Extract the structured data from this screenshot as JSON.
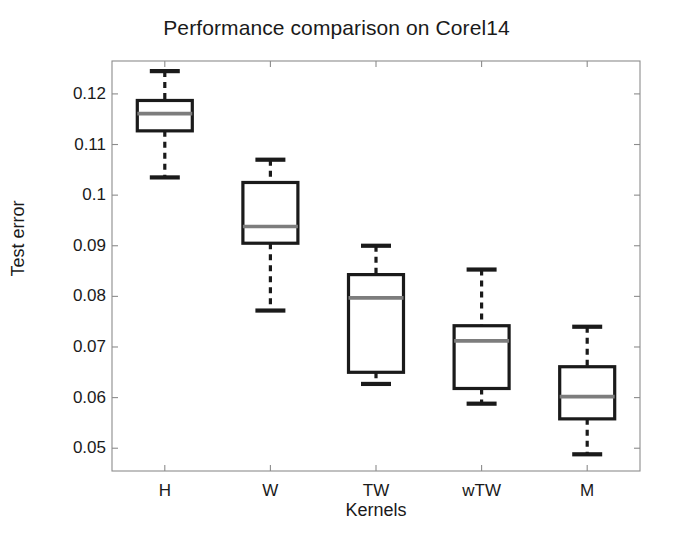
{
  "chart_data": {
    "type": "box",
    "title": "Performance comparison on Corel14",
    "xlabel": "Kernels",
    "ylabel": "Test error",
    "categories": [
      "H",
      "W",
      "TW",
      "wTW",
      "M"
    ],
    "ylim": [
      0.0455,
      0.1265
    ],
    "yticks": [
      0.05,
      0.06,
      0.07,
      0.08,
      0.09,
      0.1,
      0.11,
      0.12
    ],
    "ytick_labels": [
      "0.05",
      "0.06",
      "0.07",
      "0.08",
      "0.09",
      "0.1",
      "0.11",
      "0.12"
    ],
    "grid": false,
    "legend": null,
    "boxes": [
      {
        "category": "H",
        "whisker_low": 0.1035,
        "q1": 0.1127,
        "median": 0.1161,
        "q3": 0.1187,
        "whisker_high": 0.1245
      },
      {
        "category": "W",
        "whisker_low": 0.0772,
        "q1": 0.0905,
        "median": 0.0938,
        "q3": 0.1025,
        "whisker_high": 0.107
      },
      {
        "category": "TW",
        "whisker_low": 0.0627,
        "q1": 0.065,
        "median": 0.0797,
        "q3": 0.0843,
        "whisker_high": 0.09
      },
      {
        "category": "wTW",
        "whisker_low": 0.0588,
        "q1": 0.0618,
        "median": 0.0712,
        "q3": 0.0742,
        "whisker_high": 0.0853
      },
      {
        "category": "M",
        "whisker_low": 0.0488,
        "q1": 0.0558,
        "median": 0.0602,
        "q3": 0.0661,
        "whisker_high": 0.074
      }
    ],
    "colors": {
      "box_edge": "#1a1a1a",
      "median": "#7d7d7d",
      "whisker": "#1a1a1a",
      "cap": "#1a1a1a",
      "axis": "#8c8c8c",
      "background": "#ffffff"
    }
  }
}
